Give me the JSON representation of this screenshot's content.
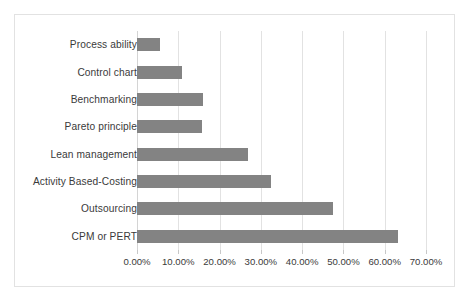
{
  "chart_data": {
    "type": "bar",
    "orientation": "horizontal",
    "title": "",
    "xlabel": "",
    "ylabel": "",
    "categories": [
      "Process ability",
      "Control chart",
      "Benchmarking",
      "Pareto principle",
      "Lean management",
      "Activity Based-Costing",
      "Outsourcing",
      "CPM or PERT"
    ],
    "values": [
      5.5,
      10.8,
      16.0,
      15.8,
      26.8,
      32.5,
      47.5,
      63.3
    ],
    "value_format": "percent",
    "xlim": [
      0,
      70
    ],
    "x_tick_values": [
      0,
      10,
      20,
      30,
      40,
      50,
      60,
      70
    ],
    "x_tick_labels": [
      "0.00%",
      "10.00%",
      "20.00%",
      "30.00%",
      "40.00%",
      "50.00%",
      "60.00%",
      "70.00%"
    ],
    "grid": "vertical",
    "legend": "none",
    "series": [
      {
        "name": "",
        "color": "#838383",
        "values": [
          5.5,
          10.8,
          16.0,
          15.8,
          26.8,
          32.5,
          47.5,
          63.3
        ]
      }
    ]
  },
  "style": {
    "bar_color": "#838383",
    "gridline_color": "#e2e2e2",
    "border_color": "#e2e2e2",
    "text_color": "#3a3a3a",
    "background": "#ffffff"
  }
}
